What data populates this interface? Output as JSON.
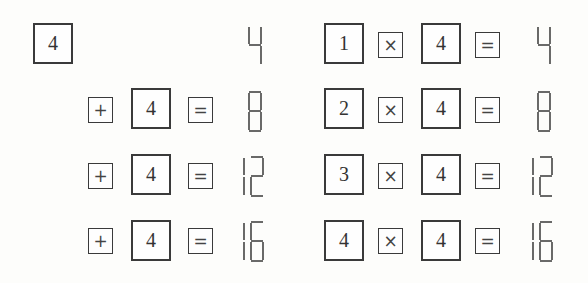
{
  "left_panel": {
    "title": "Repeated addition",
    "rows": [
      {
        "operator": null,
        "operand": "4",
        "equals": null,
        "result": "4"
      },
      {
        "operator": "+",
        "operand": "4",
        "equals": "=",
        "result": "8"
      },
      {
        "operator": "+",
        "operand": "4",
        "equals": "=",
        "result": "12"
      },
      {
        "operator": "+",
        "operand": "4",
        "equals": "=",
        "result": "16"
      }
    ]
  },
  "right_panel": {
    "title": "Multiplication",
    "rows": [
      {
        "multiplier": "1",
        "operator": "×",
        "operand": "4",
        "equals": "=",
        "result": "4"
      },
      {
        "multiplier": "2",
        "operator": "×",
        "operand": "4",
        "equals": "=",
        "result": "8"
      },
      {
        "multiplier": "3",
        "operator": "×",
        "operand": "4",
        "equals": "=",
        "result": "12"
      },
      {
        "multiplier": "4",
        "operator": "×",
        "operand": "4",
        "equals": "=",
        "result": "16"
      }
    ]
  }
}
